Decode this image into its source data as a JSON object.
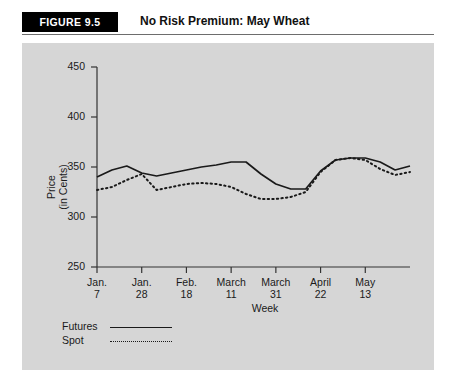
{
  "header": {
    "badge": "FIGURE 9.5",
    "title": "No Risk Premium: May Wheat"
  },
  "chart_data": {
    "type": "line",
    "title": "No Risk Premium: May Wheat",
    "xlabel": "Week",
    "ylabel": "Price\n(in Cents)",
    "ylabel_line1": "Price",
    "ylabel_line2": "(in Cents)",
    "ylim": [
      250,
      450
    ],
    "yticks": [
      250,
      300,
      350,
      400,
      450
    ],
    "grid": false,
    "legend_position": "below-left",
    "xtick_labels": [
      {
        "line1": "Jan.",
        "line2": "7"
      },
      {
        "line1": "Jan.",
        "line2": "28"
      },
      {
        "line1": "Feb.",
        "line2": "18"
      },
      {
        "line1": "March",
        "line2": "11"
      },
      {
        "line1": "March",
        "line2": "31"
      },
      {
        "line1": "April",
        "line2": "22"
      },
      {
        "line1": "May",
        "line2": "13"
      }
    ],
    "x": [
      0,
      1,
      2,
      3,
      4,
      5,
      6,
      7,
      8,
      9,
      10,
      11,
      12,
      13,
      14,
      15,
      16,
      17,
      18,
      19,
      20,
      21
    ],
    "xlim": [
      0,
      21
    ],
    "xtick_positions": [
      0,
      3,
      6,
      9,
      12,
      15,
      18
    ],
    "series": [
      {
        "name": "Futures",
        "style": "solid",
        "color": "#1a1a1a",
        "values": [
          340,
          347,
          351,
          344,
          341,
          344,
          347,
          350,
          352,
          355,
          355,
          343,
          333,
          328,
          328,
          346,
          357,
          359,
          359,
          355,
          347,
          351
        ]
      },
      {
        "name": "Spot",
        "style": "dotted",
        "color": "#1a1a1a",
        "values": [
          327,
          330,
          337,
          343,
          327,
          330,
          333,
          334,
          333,
          330,
          323,
          318,
          318,
          320,
          325,
          345,
          357,
          359,
          357,
          348,
          342,
          345
        ]
      }
    ]
  },
  "legend": {
    "items": [
      {
        "label": "Futures",
        "style": "solid"
      },
      {
        "label": "Spot",
        "style": "dotted"
      }
    ]
  }
}
